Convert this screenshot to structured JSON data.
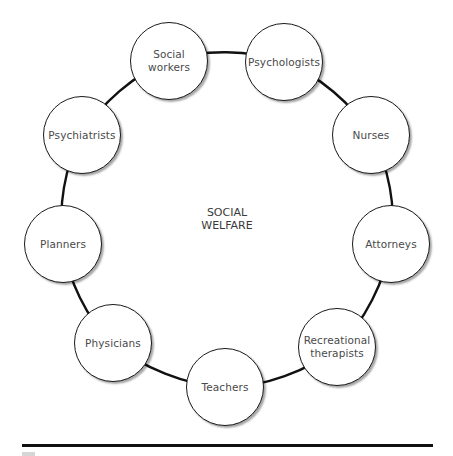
{
  "diagram": {
    "center_label": "SOCIAL\nWELFARE",
    "ring": {
      "cx": 227,
      "cy": 222,
      "r": 172,
      "stroke": "#111111"
    },
    "nodes": [
      {
        "label": "Social\nworkers",
        "x": 169,
        "y": 61
      },
      {
        "label": "Psychologists",
        "x": 284,
        "y": 62
      },
      {
        "label": "Nurses",
        "x": 371,
        "y": 135
      },
      {
        "label": "Attorneys",
        "x": 391,
        "y": 244
      },
      {
        "label": "Recreational\ntherapists",
        "x": 337,
        "y": 347
      },
      {
        "label": "Teachers",
        "x": 225,
        "y": 387
      },
      {
        "label": "Physicians",
        "x": 113,
        "y": 343
      },
      {
        "label": "Planners",
        "x": 63,
        "y": 244
      },
      {
        "label": "Psychiatrists",
        "x": 82,
        "y": 135
      }
    ]
  }
}
